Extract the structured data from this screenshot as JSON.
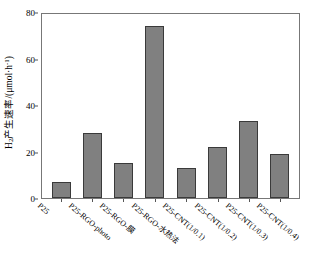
{
  "chart_data": {
    "type": "bar",
    "title": "",
    "xlabel": "",
    "ylabel": "H₂产生速率/(μmol·h⁻¹)",
    "ylim": [
      0,
      80
    ],
    "yticks": [
      0,
      20,
      40,
      60,
      80
    ],
    "grid": false,
    "legend": null,
    "bar_color": "#808080",
    "bar_edge_color": "#3a3a3a",
    "axis_color": "#777777",
    "categories": [
      "P25",
      "P25-RGO-photo",
      "P25-RGO-膜",
      "P25-RGO-水热法",
      "P25-CNT(1/0.1)",
      "P25-CNT(1/0.2)",
      "P25-CNT(1/0.3)",
      "P25-CNT(1/0.4)"
    ],
    "values": [
      7,
      28,
      15,
      74,
      13,
      22,
      33,
      19
    ]
  },
  "yaxis": {
    "label_html_parts": {
      "h": "H",
      "sub": "2",
      "mid": "产生速率/(μmol·h",
      "sup": "-1",
      "close": ")"
    },
    "tick_labels": [
      "0",
      "20",
      "40",
      "60",
      "80"
    ]
  }
}
